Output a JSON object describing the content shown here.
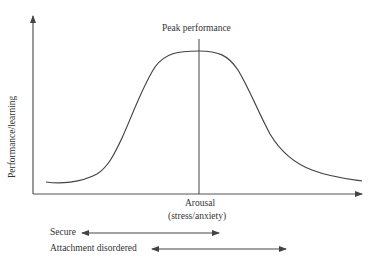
{
  "diagram": {
    "y_axis_label": "Performance/learning",
    "x_axis_label": "Arousal",
    "x_axis_sublabel": "(stress/anxiety)",
    "peak_label": "Peak performance",
    "ranges": [
      {
        "label": "Secure",
        "from_x": 82,
        "to_x": 219
      },
      {
        "label": "Attachment disordered",
        "from_x": 152,
        "to_x": 286
      }
    ],
    "colors": {
      "line": "#444444",
      "text": "#333333",
      "background": "#ffffff"
    }
  }
}
